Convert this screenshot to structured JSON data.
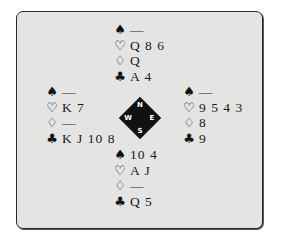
{
  "diagram": {
    "type": "bridge-deal",
    "colors": {
      "frame_bg": "#e4e4e2",
      "frame_border": "#2a2a2a",
      "compass_bg": "#111111",
      "text": "#1a1a1a"
    },
    "suit_icons": {
      "spades": "♠",
      "hearts": "♡",
      "diamonds": "♢",
      "clubs": "♣"
    },
    "compass": {
      "north": "N",
      "south": "S",
      "west": "W",
      "east": "E"
    },
    "hands": {
      "north": {
        "spades": "—",
        "hearts": "Q 8 6",
        "diamonds": "Q",
        "clubs": "A 4"
      },
      "west": {
        "spades": "—",
        "hearts": "K 7",
        "diamonds": "—",
        "clubs": "K J 10 8"
      },
      "east": {
        "spades": "—",
        "hearts": "9 5 4 3",
        "diamonds": "8",
        "clubs": "9"
      },
      "south": {
        "spades": "10 4",
        "hearts": "A J",
        "diamonds": "—",
        "clubs": "Q 5"
      }
    }
  }
}
